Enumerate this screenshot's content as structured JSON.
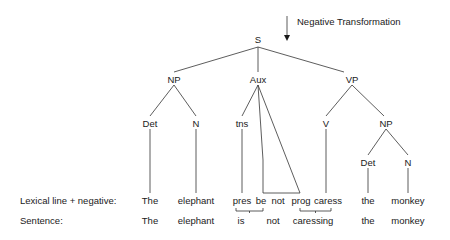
{
  "annotation": {
    "label": "Negative Transformation"
  },
  "tree": {
    "S": "S",
    "NP": "NP",
    "Aux": "Aux",
    "VP": "VP",
    "NP_Det": "Det",
    "NP_N": "N",
    "tns": "tns",
    "V": "V",
    "VP_NP": "NP",
    "VP_NP_Det": "Det",
    "VP_NP_N": "N"
  },
  "rows": {
    "lexical": {
      "label": "Lexical line + negative:",
      "words": [
        "The",
        "elephant",
        "pres",
        "be",
        "not",
        "prog",
        "caress",
        "the",
        "monkey"
      ]
    },
    "sentence": {
      "label": "Sentence:",
      "words": [
        "The",
        "elephant",
        "is",
        "not",
        "caressing",
        "the",
        "monkey"
      ]
    }
  }
}
